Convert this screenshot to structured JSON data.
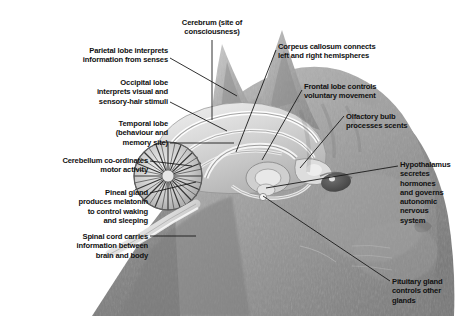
{
  "figure": {
    "background_color": "#ffffff",
    "text_color": "#111111",
    "leader_line_color": "#1a1a1a",
    "width": 463,
    "height": 316
  },
  "labels": [
    {
      "id": "parietal-lobe",
      "text": "Parietal lobe interprets\ninformation from senses",
      "align": "right",
      "x": 40,
      "y": 46,
      "w": 128,
      "leader": [
        [
          170,
          58
        ],
        [
          237,
          96
        ]
      ]
    },
    {
      "id": "cerebrum",
      "text": "Cerebrum (site of\nconsciousness)",
      "align": "center",
      "x": 160,
      "y": 18,
      "w": 104,
      "leader": [
        [
          212,
          40
        ],
        [
          212,
          120
        ]
      ]
    },
    {
      "id": "corpus-callosum",
      "text": "Corpeus callosum connects\nleft and right hemispheres",
      "align": "left",
      "x": 278,
      "y": 42,
      "w": 148,
      "leader": [
        [
          276,
          50
        ],
        [
          236,
          152
        ]
      ]
    },
    {
      "id": "occipital-lobe",
      "text": "Occipital lobe\ninterprets visual and\nsensory-hair stimuli",
      "align": "right",
      "x": 52,
      "y": 78,
      "w": 116,
      "leader": [
        [
          170,
          102
        ],
        [
          227,
          131
        ]
      ]
    },
    {
      "id": "frontal-lobe",
      "text": "Frontal lobe controls\nvoluntary movement",
      "align": "left",
      "x": 304,
      "y": 82,
      "w": 122,
      "leader": [
        [
          302,
          90
        ],
        [
          262,
          160
        ]
      ]
    },
    {
      "id": "temporal-lobe",
      "text": "Temporal lobe\n(behaviour and\nmemory site)",
      "align": "right",
      "x": 56,
      "y": 119,
      "w": 112,
      "leader": [
        [
          170,
          143
        ],
        [
          234,
          143
        ]
      ]
    },
    {
      "id": "olfactory-bulb",
      "text": "Olfactory bulb\nprocesses scents",
      "align": "left",
      "x": 346,
      "y": 112,
      "w": 108,
      "leader": [
        [
          344,
          116
        ],
        [
          300,
          168
        ]
      ]
    },
    {
      "id": "cerebellum",
      "text": "Cerebellum co-ordinates\nmotor activity",
      "align": "right",
      "x": 14,
      "y": 156,
      "w": 134,
      "leader": [
        [
          150,
          161
        ],
        [
          192,
          166
        ]
      ]
    },
    {
      "id": "hypothalamus",
      "text": "Hypothalamus\nsecretes\nhormones\nand governs\nautonomic\nnervous\nsystem",
      "align": "left",
      "x": 400,
      "y": 160,
      "w": 60,
      "leader": [
        [
          398,
          166
        ],
        [
          266,
          188
        ]
      ]
    },
    {
      "id": "pineal-gland",
      "text": "Pineal gland\nproduces melatonin\nto control waking\nand sleeping",
      "align": "right",
      "x": 28,
      "y": 188,
      "w": 120,
      "leader": [
        [
          150,
          193
        ],
        [
          196,
          182
        ]
      ]
    },
    {
      "id": "spinal-cord",
      "text": "Spinal cord carries\ninformation between\nbrain and body",
      "align": "right",
      "x": 16,
      "y": 232,
      "w": 132,
      "leader": [
        [
          150,
          236
        ],
        [
          196,
          236
        ]
      ]
    },
    {
      "id": "pituitary-gland",
      "text": "Pituitary gland\ncontrols other\nglands",
      "align": "left",
      "x": 392,
      "y": 277,
      "w": 70,
      "leader": [
        [
          390,
          281
        ],
        [
          263,
          196
        ]
      ]
    }
  ],
  "anatomy_parts": [
    "ear-left",
    "ear-right",
    "cerebrum",
    "cerebellum",
    "corpus-callosum",
    "brain-stem",
    "spinal-cord",
    "olfactory-bulb",
    "pituitary-gland",
    "pineal-gland",
    "hypothalamus",
    "eye",
    "nose",
    "muzzle",
    "head-outline"
  ]
}
